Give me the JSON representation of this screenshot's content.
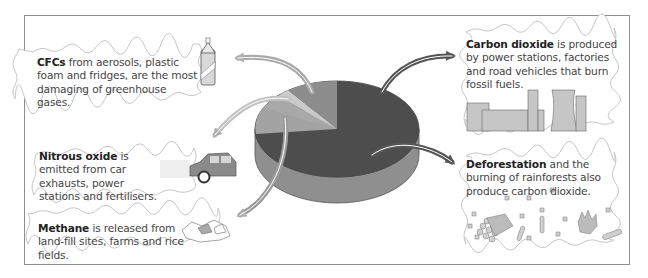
{
  "diagram": {
    "type": "pie-3d-with-callouts",
    "colors": {
      "carbon_dioxide": "#4d4d4d",
      "cfcs": "#8d8d8d",
      "nitrous_oxide": "#c4c4c4",
      "methane": "#a3a3a3",
      "pie_side": "#8f8f8f",
      "arrow_dark": "#555555",
      "arrow_light": "#b0b0b0",
      "frame": "#8e8e8e"
    },
    "callouts": {
      "cfcs": {
        "title": "CFCs",
        "text": " from aerosols, plastic foam and fridges, are the most damaging of greenhouse gases.",
        "icon": "spray-can-icon"
      },
      "nitrous_oxide": {
        "title": "Nitrous oxide",
        "text": " is emitted from car exhausts, power stations and fertilisers.",
        "icon": "car-icon"
      },
      "methane": {
        "title": "Methane",
        "text": " is released from land-fill sites, farms and rice fields.",
        "icon": "landfill-icon"
      },
      "carbon_dioxide": {
        "title": "Carbon dioxide",
        "text": " is produced by power stations, factories and road vehicles that burn fossil fuels.",
        "icon": "factory-icon"
      },
      "deforestation": {
        "title": "Deforestation",
        "text": " and the burning of rainforests also produce carbon dioxide.",
        "icon": "logs-fire-icon"
      }
    }
  }
}
